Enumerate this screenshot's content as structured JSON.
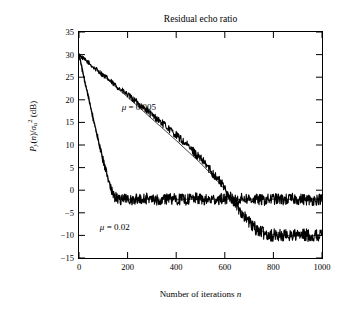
{
  "chart_data": {
    "type": "line",
    "title": "Residual echo ratio",
    "xlabel": "Number of iterations n",
    "ylabel": "P_y(n)/sigma_u^2 (dB)",
    "xlim": [
      0,
      1000
    ],
    "ylim": [
      -15,
      35
    ],
    "xticks": [
      0,
      200,
      400,
      600,
      800,
      1000
    ],
    "yticks": [
      -15,
      -10,
      -5,
      0,
      5,
      10,
      15,
      20,
      25,
      30,
      35
    ],
    "grid": false,
    "legend_position": "inline-annotations",
    "annotations": [
      {
        "text": "μ = 0.005",
        "x": 270,
        "y": 16
      },
      {
        "text": "μ = 0.02",
        "x": 180,
        "y": -7.5
      }
    ],
    "series": [
      {
        "name": "mu = 0.005 (noisy)",
        "color": "#000000",
        "comment": "slow-decaying simulated curve, settles near -10 dB after n~700",
        "x": [
          0,
          20,
          40,
          60,
          80,
          100,
          120,
          140,
          160,
          180,
          200,
          220,
          240,
          260,
          280,
          300,
          320,
          340,
          360,
          380,
          400,
          420,
          440,
          460,
          480,
          500,
          520,
          540,
          560,
          580,
          600,
          620,
          640,
          660,
          680,
          700,
          720,
          740,
          760,
          780,
          800,
          820,
          840,
          860,
          880,
          900,
          920,
          940,
          960,
          980,
          1000
        ],
        "y": [
          30.0,
          29.0,
          28.2,
          27.1,
          26.4,
          25.4,
          24.6,
          23.6,
          22.8,
          21.9,
          21.1,
          20.2,
          19.4,
          18.4,
          17.7,
          16.6,
          15.9,
          14.9,
          14.1,
          13.1,
          12.2,
          11.2,
          10.2,
          9.1,
          8.1,
          6.9,
          5.8,
          4.5,
          3.2,
          1.9,
          0.4,
          -1.2,
          -2.8,
          -4.3,
          -5.8,
          -7.1,
          -8.2,
          -9.0,
          -9.5,
          -9.8,
          -10.0,
          -9.9,
          -10.1,
          -10.0,
          -9.8,
          -10.1,
          -10.0,
          -9.9,
          -10.2,
          -10.0,
          -9.9
        ]
      },
      {
        "name": "mu = 0.005 (theory)",
        "color": "#000000",
        "comment": "smooth theoretical curve overlapping noisy slow curve",
        "x": [
          0,
          50,
          100,
          150,
          200,
          250,
          300,
          350,
          400,
          450,
          500,
          550,
          600,
          650,
          700,
          750,
          800,
          850,
          900,
          950,
          1000
        ],
        "y": [
          30.0,
          27.6,
          25.3,
          22.9,
          20.6,
          18.2,
          15.8,
          13.4,
          11.0,
          8.5,
          6.0,
          3.2,
          0.2,
          -3.3,
          -6.8,
          -9.0,
          -9.8,
          -10.0,
          -10.0,
          -10.0,
          -10.0
        ]
      },
      {
        "name": "mu = 0.02 (noisy)",
        "color": "#000000",
        "comment": "fast-decaying simulated curve, settles near -2 dB after n~180",
        "x": [
          0,
          10,
          20,
          30,
          40,
          50,
          60,
          70,
          80,
          90,
          100,
          110,
          120,
          130,
          140,
          150,
          160,
          170,
          180,
          200,
          240,
          280,
          320,
          360,
          400,
          440,
          480,
          520,
          560,
          600,
          640,
          680,
          720,
          760,
          800,
          840,
          880,
          920,
          960,
          1000
        ],
        "y": [
          30.0,
          27.5,
          25.0,
          22.6,
          20.2,
          17.8,
          15.4,
          13.1,
          10.9,
          8.6,
          6.4,
          4.3,
          2.3,
          0.4,
          -0.8,
          -1.6,
          -1.9,
          -2.1,
          -2.0,
          -1.9,
          -2.1,
          -1.8,
          -2.2,
          -1.9,
          -2.0,
          -2.1,
          -1.8,
          -2.2,
          -2.0,
          -1.9,
          -2.1,
          -1.8,
          -2.0,
          -2.2,
          -1.9,
          -2.1,
          -1.9,
          -2.0,
          -2.2,
          -1.9
        ]
      },
      {
        "name": "mu = 0.02 (theory)",
        "color": "#000000",
        "comment": "smooth theoretical curve for fast decay",
        "x": [
          0,
          20,
          40,
          60,
          80,
          100,
          120,
          140,
          160,
          180,
          200,
          300,
          400,
          600,
          800,
          1000
        ],
        "y": [
          30.0,
          25.2,
          20.3,
          15.5,
          10.8,
          6.3,
          2.4,
          -0.5,
          -1.6,
          -1.9,
          -2.0,
          -2.0,
          -2.0,
          -2.0,
          -2.0,
          -2.0
        ]
      }
    ]
  }
}
